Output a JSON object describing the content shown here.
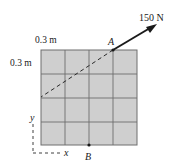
{
  "diagram": {
    "force_label": "150 N",
    "point_a_label": "A",
    "point_b_label": "B",
    "horizontal_spacing_label": "0.3 m",
    "vertical_spacing_label": "0.3 m",
    "x_axis_label": "x",
    "y_axis_label": "y",
    "grid": {
      "rows": 4,
      "cols": 4,
      "cell_size_m": 0.3
    },
    "colors": {
      "plate_fill": "#cfcfcf",
      "grid_line": "#6e6e6e",
      "ink": "#1a1a1a"
    }
  }
}
